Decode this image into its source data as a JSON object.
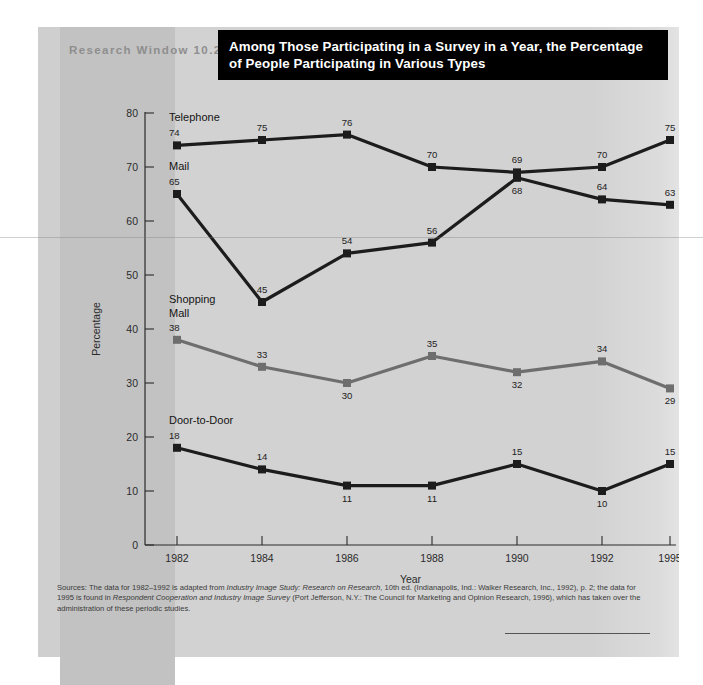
{
  "header": {
    "research_window_label": "Research Window 10.2",
    "title_line1": "Among Those Participating in a Survey in a Year, the Percentage",
    "title_line2": "of People Participating in Various Types"
  },
  "chart_data": {
    "type": "line",
    "title": "Among Those Participating in a Survey in a Year, the Percentage of People Participating in Various Types",
    "xlabel": "Year",
    "ylabel": "Percentage",
    "categories": [
      "1982",
      "1984",
      "1986",
      "1988",
      "1990",
      "1992",
      "1995"
    ],
    "ylim": [
      0,
      80
    ],
    "yticks": [
      0,
      10,
      20,
      30,
      40,
      50,
      60,
      70,
      80
    ],
    "grid": false,
    "legend": "inline-labels-at-left",
    "series": [
      {
        "name": "Telephone",
        "color": "#1c1c1c",
        "values": [
          74,
          75,
          76,
          70,
          69,
          70,
          75
        ]
      },
      {
        "name": "Mail",
        "color": "#1c1c1c",
        "values": [
          65,
          45,
          54,
          56,
          68,
          64,
          63
        ]
      },
      {
        "name": "Shopping Mall",
        "color": "#6e6e6e",
        "values": [
          38,
          33,
          30,
          35,
          32,
          34,
          29
        ]
      },
      {
        "name": "Door-to-Door",
        "color": "#1c1c1c",
        "values": [
          18,
          14,
          11,
          11,
          15,
          10,
          15
        ]
      }
    ],
    "series_label_lines": {
      "telephone": [
        "Telephone"
      ],
      "mail": [
        "Mail"
      ],
      "shopping_mall": [
        "Shopping",
        "Mall"
      ],
      "door_to_door": [
        "Door-to-Door"
      ]
    }
  },
  "source": {
    "line1_a": "Sources: The data for 1982–1992 is adapted from ",
    "line1_i": "Industry Image Study: Research on Research",
    "line1_b": ", 10th ed. (Indianapolis, Ind.: Walker Research, Inc., 1992), p. 2; the data for",
    "line2_a": "1995 is found in ",
    "line2_i": "Respondent Cooperation and Industry Image Survey",
    "line2_b": " (Port Jefferson, N.Y.: The Council for Marketing and Opinion Research, 1996), which has taken over the",
    "line3": "administration of these periodic studies."
  }
}
